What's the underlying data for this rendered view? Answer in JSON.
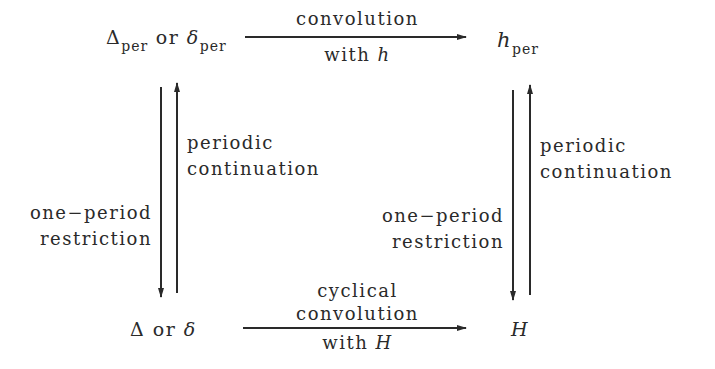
{
  "nodes": {
    "top_left": {
      "sym1": "Δ",
      "sub1": "per",
      "or": "or",
      "sym2": "δ",
      "sub2": "per"
    },
    "top_right": {
      "sym": "h",
      "sub": "per"
    },
    "bottom_left": {
      "sym1": "Δ",
      "or": "or",
      "sym2": "δ"
    },
    "bottom_right": {
      "sym": "H"
    }
  },
  "edges": {
    "top": {
      "line1": "convolution",
      "line2_text": "with",
      "line2_sym": "h"
    },
    "bottom": {
      "line1": "cyclical",
      "line2": "convolution",
      "line3_text": "with",
      "line3_sym": "H"
    },
    "left_down": {
      "line1": "one−period",
      "line2": "restriction"
    },
    "left_up": {
      "line1": "periodic",
      "line2": "continuation"
    },
    "right_down": {
      "line1": "one−period",
      "line2": "restriction"
    },
    "right_up": {
      "line1": "periodic",
      "line2": "continuation"
    }
  }
}
